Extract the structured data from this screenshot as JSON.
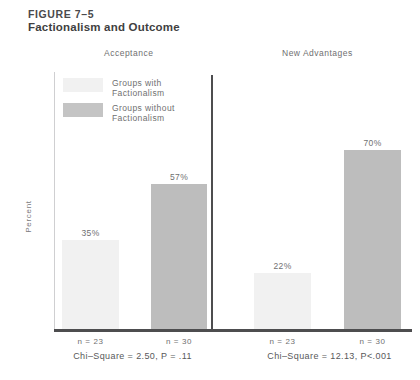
{
  "figure": {
    "number": "FIGURE 7–5",
    "title": "Factionalism and Outcome",
    "ylabel": "Percent"
  },
  "legend": [
    {
      "label": "Groups with\nFactionalism",
      "color": "#f1f1f1",
      "key": "with"
    },
    {
      "label": "Groups without\nFactionalism",
      "color": "#c4c4c4",
      "key": "without"
    }
  ],
  "panels": [
    {
      "header": "Acceptance",
      "stat": "Chi–Square = 2.50, P = .11",
      "bars": [
        {
          "value_label": "35%",
          "value": 35,
          "n_label": "n = 23",
          "n": 23,
          "series": "Groups with Factionalism",
          "color": "#f1f1f1"
        },
        {
          "value_label": "57%",
          "value": 57,
          "n_label": "n = 30",
          "n": 30,
          "series": "Groups without Factionalism",
          "color": "#bdbdbd"
        }
      ]
    },
    {
      "header": "New Advantages",
      "stat": "Chi–Square = 12.13, P<.001",
      "bars": [
        {
          "value_label": "22%",
          "value": 22,
          "n_label": "n = 23",
          "n": 23,
          "series": "Groups with Factionalism",
          "color": "#f1f1f1"
        },
        {
          "value_label": "70%",
          "value": 70,
          "n_label": "n = 30",
          "n": 30,
          "series": "Groups without Factionalism",
          "color": "#bdbdbd"
        }
      ]
    }
  ],
  "chart_data": {
    "type": "bar",
    "title": "Factionalism and Outcome",
    "xlabel": "",
    "ylabel": "Percent",
    "ylim": [
      0,
      100
    ],
    "grid": false,
    "legend_position": "top-left",
    "panels": [
      "Acceptance",
      "New Advantages"
    ],
    "categories": [
      "Acceptance",
      "New Advantages"
    ],
    "series": [
      {
        "name": "Groups with Factionalism",
        "values": [
          35,
          22
        ],
        "n": [
          23,
          23
        ],
        "color": "#f1f1f1"
      },
      {
        "name": "Groups without Factionalism",
        "values": [
          57,
          70
        ],
        "n": [
          30,
          30
        ],
        "color": "#bdbdbd"
      }
    ],
    "annotations": [
      "Chi–Square = 2.50, P = .11",
      "Chi–Square = 12.13, P<.001"
    ]
  }
}
